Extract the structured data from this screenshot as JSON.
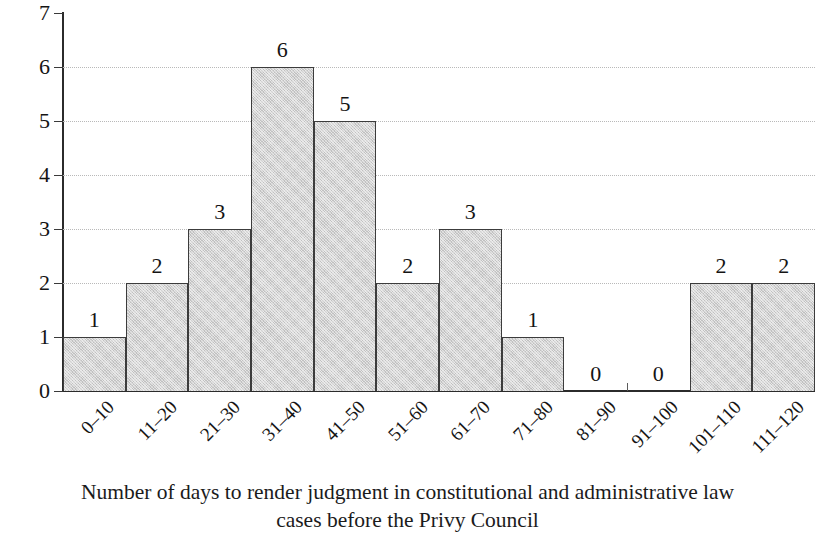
{
  "chart_data": {
    "type": "bar",
    "title": "",
    "subtitle": "",
    "xlabel": "",
    "ylabel": "Number of cases",
    "caption_line_1": "Number of days to render judgment in constitutional and administrative law",
    "caption_line_2": "cases before the Privy Council",
    "categories": [
      "0–10",
      "11–20",
      "21–30",
      "31–40",
      "41–50",
      "51–60",
      "61–70",
      "71–80",
      "81–90",
      "91–100",
      "101–110",
      "111–120"
    ],
    "values": [
      1,
      2,
      3,
      6,
      5,
      2,
      3,
      1,
      0,
      0,
      2,
      2
    ],
    "value_labels": [
      "1",
      "2",
      "3",
      "6",
      "5",
      "2",
      "3",
      "1",
      "0",
      "0",
      "2",
      "2"
    ],
    "ylim": [
      0,
      7
    ],
    "ytick_labels": [
      "0",
      "1",
      "2",
      "3",
      "4",
      "5",
      "6",
      "7"
    ],
    "ytick_values": [
      0,
      1,
      2,
      3,
      4,
      5,
      6,
      7
    ],
    "grid": true,
    "grid_values": [
      2,
      3,
      4,
      5,
      6
    ],
    "legend": null,
    "legend_position": "none",
    "bar_fill_color": "#d3d3d3",
    "bar_border_color": "#3c3c3c",
    "axis_color": "#2b2b2b",
    "grid_color": "#b9b9b9",
    "text_color": "#141414",
    "bar_gap": 0,
    "histogram": true
  }
}
